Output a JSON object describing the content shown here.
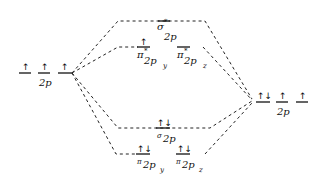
{
  "diagram": {
    "type": "molecular-orbital-diagram",
    "left_atom": {
      "label": "2p",
      "orbitals": [
        {
          "electrons": "↑"
        },
        {
          "electrons": "↑"
        },
        {
          "electrons": "↑"
        }
      ]
    },
    "right_atom": {
      "label": "2p",
      "orbitals": [
        {
          "electrons": "↑↓"
        },
        {
          "electrons": "↑"
        },
        {
          "electrons": "↑"
        }
      ]
    },
    "molecular_orbitals": {
      "sigma_star_2p": {
        "symbol": "σ",
        "star": "*",
        "subscript": "2p",
        "electrons": ""
      },
      "pi_star_2py": {
        "symbol": "π",
        "star": "*",
        "subscript": "2p",
        "subsub": "y",
        "electrons": "↑"
      },
      "pi_star_2pz": {
        "symbol": "π",
        "star": "*",
        "subscript": "2p",
        "subsub": "z",
        "electrons": ""
      },
      "sigma_2p": {
        "symbol": "σ",
        "subscript": "2p",
        "electrons": "↑↓"
      },
      "pi_2py": {
        "symbol": "π",
        "subscript": "2p",
        "subsub": "y",
        "electrons": "↑↓"
      },
      "pi_2pz": {
        "symbol": "π",
        "subscript": "2p",
        "subsub": "z",
        "electrons": "↑↓"
      }
    }
  }
}
